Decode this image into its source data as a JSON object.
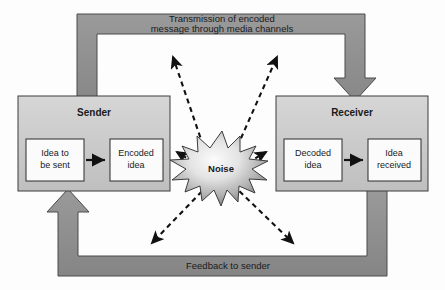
{
  "diagram": {
    "colors": {
      "background": "#fdfdfd",
      "band_fill": "#8e8e8e",
      "band_stroke": "#4a4a4a",
      "box_fill": "#c9c9c9",
      "box_stroke": "#3c3c3c",
      "inner_box_fill": "#fbfbfb",
      "inner_box_stroke": "#2b2b2b",
      "arrow_solid": "#111111",
      "arrow_dashed": "#111111",
      "noise_fill_center": "#f2f2f2",
      "noise_fill_edge": "#8d8d8d",
      "noise_stroke": "#3c3c3c",
      "text": "#1a1a1a"
    },
    "bands": {
      "transmission": {
        "name": "transmission-band",
        "label_line1": "Transmission of encoded",
        "label_line2": "message through media channels",
        "direction": "sender-to-receiver"
      },
      "feedback": {
        "name": "feedback-band",
        "label": "Feedback to sender",
        "direction": "receiver-to-sender"
      }
    },
    "sender": {
      "title": "Sender",
      "steps": [
        {
          "line1": "Idea to",
          "line2": "be sent"
        },
        {
          "line1": "Encoded",
          "line2": "idea"
        }
      ]
    },
    "receiver": {
      "title": "Receiver",
      "steps": [
        {
          "line1": "Decoded",
          "line2": "idea"
        },
        {
          "line1": "Idea",
          "line2": "received"
        }
      ]
    },
    "noise": {
      "label": "Noise",
      "arrow_count": 6,
      "arrow_directions": [
        "up-left",
        "up-right",
        "left",
        "right",
        "down-left",
        "down-right"
      ]
    }
  }
}
